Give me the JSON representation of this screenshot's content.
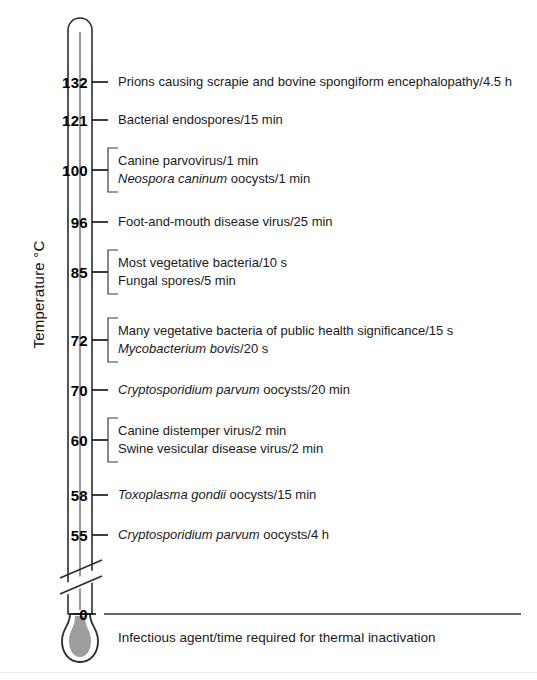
{
  "axis": {
    "title": "Temperature °C",
    "unit": "°C",
    "ticks": [
      {
        "value": "132",
        "y": 82
      },
      {
        "value": "121",
        "y": 120
      },
      {
        "value": "100",
        "y": 170
      },
      {
        "value": "96",
        "y": 222
      },
      {
        "value": "85",
        "y": 272
      },
      {
        "value": "72",
        "y": 340
      },
      {
        "value": "70",
        "y": 390
      },
      {
        "value": "60",
        "y": 440
      },
      {
        "value": "58",
        "y": 495
      },
      {
        "value": "55",
        "y": 535
      },
      {
        "value": "0",
        "y": 614
      }
    ]
  },
  "caption": "Infectious agent/time required for thermal inactivation",
  "entries": [
    {
      "tick": "132",
      "y": 82,
      "bracket": false,
      "lines": [
        {
          "parts": [
            {
              "text": "Prions causing scrapie and bovine spongiform encephalopathy/4.5 h",
              "italic": false
            }
          ]
        }
      ]
    },
    {
      "tick": "121",
      "y": 120,
      "bracket": false,
      "lines": [
        {
          "parts": [
            {
              "text": "Bacterial endospores/15 min",
              "italic": false
            }
          ]
        }
      ]
    },
    {
      "tick": "100",
      "y": 170,
      "bracket": true,
      "lines": [
        {
          "parts": [
            {
              "text": "Canine parvovirus/1 min",
              "italic": false
            }
          ]
        },
        {
          "parts": [
            {
              "text": "Neospora caninum",
              "italic": true
            },
            {
              "text": " oocysts/1 min",
              "italic": false
            }
          ]
        }
      ]
    },
    {
      "tick": "96",
      "y": 222,
      "bracket": false,
      "lines": [
        {
          "parts": [
            {
              "text": "Foot-and-mouth disease virus/25 min",
              "italic": false
            }
          ]
        }
      ]
    },
    {
      "tick": "85",
      "y": 272,
      "bracket": true,
      "lines": [
        {
          "parts": [
            {
              "text": "Most vegetative bacteria/10 s",
              "italic": false
            }
          ]
        },
        {
          "parts": [
            {
              "text": "Fungal spores/5 min",
              "italic": false
            }
          ]
        }
      ]
    },
    {
      "tick": "72",
      "y": 340,
      "bracket": true,
      "lines": [
        {
          "parts": [
            {
              "text": "Many vegetative bacteria of public health significance/15 s",
              "italic": false
            }
          ]
        },
        {
          "parts": [
            {
              "text": "Mycobacterium bovis",
              "italic": true
            },
            {
              "text": "/20 s",
              "italic": false
            }
          ]
        }
      ]
    },
    {
      "tick": "70",
      "y": 390,
      "bracket": false,
      "lines": [
        {
          "parts": [
            {
              "text": "Cryptosporidium parvum",
              "italic": true
            },
            {
              "text": " oocysts/20 min",
              "italic": false
            }
          ]
        }
      ]
    },
    {
      "tick": "60",
      "y": 440,
      "bracket": true,
      "lines": [
        {
          "parts": [
            {
              "text": "Canine distemper virus/2 min",
              "italic": false
            }
          ]
        },
        {
          "parts": [
            {
              "text": "Swine vesicular disease virus/2 min",
              "italic": false
            }
          ]
        }
      ]
    },
    {
      "tick": "58",
      "y": 495,
      "bracket": false,
      "lines": [
        {
          "parts": [
            {
              "text": "Toxoplasma gondii",
              "italic": true
            },
            {
              "text": " oocysts/15 min",
              "italic": false
            }
          ]
        }
      ]
    },
    {
      "tick": "55",
      "y": 535,
      "bracket": false,
      "lines": [
        {
          "parts": [
            {
              "text": "Cryptosporidium parvum",
              "italic": true
            },
            {
              "text": " oocysts/4 h",
              "italic": false
            }
          ]
        }
      ]
    }
  ],
  "colors": {
    "ink": "#1a1a1a",
    "tube_stroke": "#2b2b2b",
    "capillary": "#9a9a9a",
    "bulb_fill": "#9e9e9e",
    "baseline": "#333333",
    "page_rule": "#e8e8e8"
  },
  "thermometer": {
    "tube_left": 68,
    "tube_right": 92,
    "top_y": 18,
    "break_y": 572,
    "zero_y": 614,
    "bulb_center_y": 641
  }
}
